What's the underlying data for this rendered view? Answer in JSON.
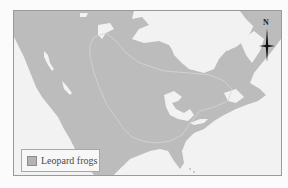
{
  "map": {
    "colors": {
      "land": "#bcbcbc",
      "water": "#f2f2f2",
      "range": "#b3b3b3",
      "frame": "#9a9a9a",
      "range_outline": "#d4d4d4"
    },
    "compass": {
      "label": "N",
      "icon": "north-arrow-icon"
    },
    "legend": {
      "items": [
        {
          "label": "Leopard frogs",
          "swatch_color": "#b3b3b3"
        }
      ]
    }
  }
}
